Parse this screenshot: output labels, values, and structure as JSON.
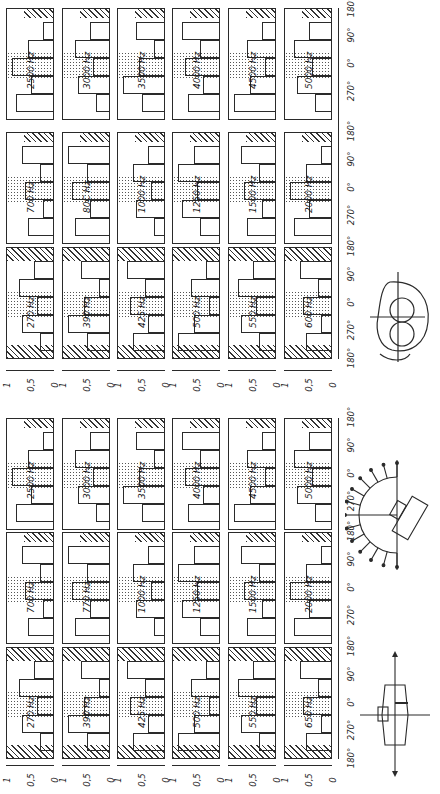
{
  "figure_top": {
    "groups": [
      {
        "frequencies": [
          "2500 Hz",
          "3000 Hz",
          "3500 Hz",
          "4000 Hz",
          "4500 Hz",
          "5000 Hz"
        ]
      },
      {
        "frequencies": [
          "700 Hz",
          "80C Hz",
          "1000 Hz",
          "1250 Hz",
          "1500 Hz",
          "2000 Hz"
        ]
      },
      {
        "frequencies": [
          "270 Hz",
          "390 Hz",
          "425 Hz",
          "500 Hz",
          "550 Hz",
          "600 Hz"
        ]
      }
    ],
    "angle_ticks": [
      "180°",
      "90°",
      "0°",
      "270°",
      "180°",
      "90°",
      "0°",
      "270°",
      "180°",
      "90°",
      "0°",
      "270°",
      "180°"
    ],
    "y_ticks": [
      "1",
      "0,5",
      "0"
    ],
    "diagram": {
      "name": "head-with-headphones",
      "labels": [
        "270°",
        "0°",
        "90°",
        "180°"
      ]
    }
  },
  "figure_bottom": {
    "groups": [
      {
        "frequencies": [
          "2500 Hz",
          "3000 Hz",
          "3500 Hz",
          "4000 Hz",
          "4500 Hz",
          "5000 Hz"
        ]
      },
      {
        "frequencies": [
          "700 Hz",
          "770 Hz",
          "1000 Hz",
          "1250 Hz",
          "1500 Hz",
          "2000 Hz"
        ]
      },
      {
        "frequencies": [
          "270 Hz",
          "390 Hz",
          "425 Hz",
          "500 Hz",
          "550 Hz",
          "650 Hz"
        ]
      }
    ],
    "angle_ticks": [
      "180°",
      "90°",
      "0°",
      "270°",
      "180°",
      "90°",
      "0°",
      "270°",
      "180°",
      "90°",
      "0°",
      "270°",
      "180°"
    ],
    "y_ticks": [
      "1",
      "0,5",
      "0"
    ],
    "diagram_semicircle": {
      "name": "loudspeaker-semicircle"
    },
    "diagram_cross": {
      "name": "source-cross",
      "labels": [
        "270°",
        "0°",
        "180°",
        "90°"
      ]
    }
  },
  "chart_data": [
    {
      "type": "bar",
      "title": "Directional localization histograms (headphone listening)",
      "xlabel": "Azimuth (degrees)",
      "ylabel": "Relative frequency",
      "x_ticks": [
        "180°",
        "270°",
        "0°",
        "90°",
        "180°"
      ],
      "ylim": [
        0,
        1
      ],
      "y_ticks": [
        "0",
        "0,5",
        "1"
      ],
      "panels": [
        "270 Hz",
        "390 Hz",
        "425 Hz",
        "500 Hz",
        "550 Hz",
        "600 Hz",
        "700 Hz",
        "80C Hz",
        "1000 Hz",
        "1250 Hz",
        "1500 Hz",
        "2000 Hz",
        "2500 Hz",
        "3000 Hz",
        "3500 Hz",
        "4000 Hz",
        "4500 Hz",
        "5000 Hz"
      ],
      "legend": [
        "dotted = front region",
        "hatched = rear region"
      ]
    },
    {
      "type": "bar",
      "title": "Directional localization histograms (loudspeaker listening)",
      "xlabel": "Azimuth (degrees)",
      "ylabel": "Relative frequency",
      "x_ticks": [
        "180°",
        "270°",
        "0°",
        "90°",
        "180°"
      ],
      "ylim": [
        0,
        1
      ],
      "y_ticks": [
        "0",
        "0,5",
        "1"
      ],
      "panels": [
        "270 Hz",
        "390 Hz",
        "425 Hz",
        "500 Hz",
        "550 Hz",
        "650 Hz",
        "700 Hz",
        "770 Hz",
        "1000 Hz",
        "1250 Hz",
        "1500 Hz",
        "2000 Hz",
        "2500 Hz",
        "3000 Hz",
        "3500 Hz",
        "4000 Hz",
        "4500 Hz",
        "5000 Hz"
      ],
      "legend": [
        "dotted = front region",
        "hatched = rear region"
      ]
    }
  ]
}
